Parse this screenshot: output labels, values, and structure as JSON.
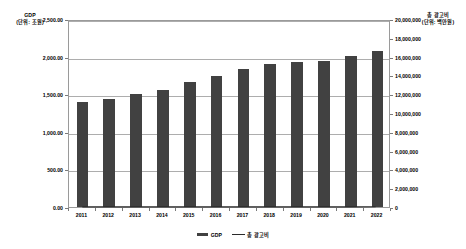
{
  "chart_data": {
    "type": "bar",
    "title": "",
    "categories": [
      "2011",
      "2012",
      "2013",
      "2014",
      "2015",
      "2016",
      "2017",
      "2018",
      "2019",
      "2020",
      "2021",
      "2022"
    ],
    "series": [
      {
        "name": "GDP",
        "kind": "bar",
        "axis": "left",
        "unit_label": "(단위: 조원)",
        "values": [
          1400,
          1440,
          1500,
          1560,
          1660,
          1740,
          1835,
          1900,
          1925,
          1945,
          2010,
          2080
        ]
      },
      {
        "name": "총 광고비",
        "kind": "line",
        "axis": "right",
        "unit_label": "(단위: 백만원)",
        "values": [
          9400,
          10400,
          10800,
          11450,
          11900,
          12350,
          13100,
          13700,
          14350,
          14200,
          16100,
          18600
        ]
      }
    ],
    "left_axis": {
      "label": "GDP",
      "unit": "(단위: 조원)",
      "ticks": [
        "0.00",
        "500.00",
        "1,000.00",
        "1,500.00",
        "2,000.00",
        "2,500.00"
      ],
      "min": 0,
      "max": 2500,
      "step": 500
    },
    "right_axis": {
      "label": "총 광고비",
      "unit": "(단위: 백만원)",
      "ticks": [
        "0",
        "2,000,000",
        "4,000,000",
        "6,000,000",
        "8,000,000",
        "10,000,000",
        "12,000,000",
        "14,000,000",
        "16,000,000",
        "18,000,000",
        "20,000,000"
      ],
      "min": 0,
      "max": 20000000,
      "step": 2000000
    },
    "xlabel": "",
    "grid": true,
    "legend": {
      "position": "bottom",
      "entries": [
        {
          "label": "GDP",
          "marker": "bar",
          "color": "#414141"
        },
        {
          "label": "총 광고비",
          "marker": "line",
          "color": "#2a2a2a"
        }
      ]
    },
    "colors": {
      "bar": "#414141",
      "line": "#2a2a2a",
      "grid": "#adadad",
      "frame": "#9a9a9a",
      "background": "#ffffff"
    }
  }
}
